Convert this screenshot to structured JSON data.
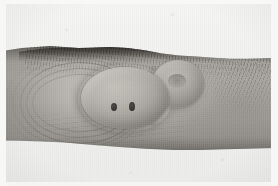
{
  "image": {
    "kind": "clinical-photograph",
    "modality": "color photography, desaturated / grayscale print",
    "caption": "Clinical photograph of the flexor aspect of a forearm showing two adjacent skin-coloured dome-shaped nodules; the larger nodule bears two dark central punctae and the smaller adjacent nodule is umbilicated.",
    "orientation": "landscape",
    "width_px": 278,
    "height_px": 186
  },
  "background": {
    "label": "plain pale photographic backdrop",
    "color": "#f2f2f0",
    "margin_color": "#f7f7f5"
  },
  "subject": {
    "label": "forearm",
    "region": "flexor surface of forearm / antecubital region",
    "skin_tone_color": "#adaaa4",
    "shadow_color": "#6e6b66",
    "highlight_color": "#c3c0ba"
  },
  "features": [
    {
      "id": "lesion-primary",
      "label": "large dome-shaped nodule",
      "position": "centre-left",
      "surface_color": "#b7b4ae",
      "notes": "smooth, shiny, skin-coloured; two dark punctae on the surface"
    },
    {
      "id": "punctum-left",
      "label": "left central punctum",
      "color": "#3a3835"
    },
    {
      "id": "punctum-right",
      "label": "right central punctum",
      "color": "#3a3835"
    },
    {
      "id": "lesion-secondary",
      "label": "smaller adjacent nodule",
      "position": "centre-right",
      "surface_color": "#b1aea8",
      "notes": "umbilicated centre, partially confluent with the larger nodule"
    },
    {
      "id": "skin-folds",
      "label": "concentric skin folds radiating from the lesion",
      "color": "#56534f"
    },
    {
      "id": "hair",
      "label": "terminal hair along the superior margin of the forearm",
      "color": "#282624"
    }
  ],
  "annotations": {
    "text_overlays": [],
    "scale_bar": null,
    "labels_visible": "none"
  }
}
